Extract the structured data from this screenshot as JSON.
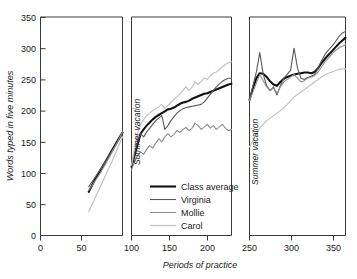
{
  "chart_data": {
    "type": "line",
    "title": "",
    "xlabel": "Periods of practice",
    "ylabel": "Words typed in five minutes",
    "ylim": [
      0,
      350
    ],
    "yticks": [
      0,
      50,
      100,
      150,
      200,
      250,
      300,
      350
    ],
    "xticks": [
      0,
      50,
      100,
      150,
      200,
      250,
      300,
      350
    ],
    "grid": false,
    "legend_position": "inner-lower-left-of-middle-panel",
    "panels": [
      {
        "name": "panel-1",
        "xlim": [
          0,
          85
        ]
      },
      {
        "name": "panel-2",
        "xlim": [
          100,
          232
        ]
      },
      {
        "name": "panel-3",
        "xlim": [
          250,
          362
        ]
      }
    ],
    "annotations": [
      {
        "text": "Summer vacation",
        "panel": "panel-2",
        "orientation": "vertical"
      },
      {
        "text": "Summer vacation",
        "panel": "panel-3",
        "orientation": "vertical"
      }
    ],
    "series": [
      {
        "name": "Class average",
        "color": "#111111",
        "width": 2.1,
        "segments": [
          {
            "x": [
              50,
              56,
              62,
              68,
              74,
              80,
              85
            ],
            "y": [
              70,
              88,
              104,
              120,
              136,
              152,
              165
            ]
          },
          {
            "x": [
              100,
              104,
              108,
              112,
              116,
              120,
              124,
              128,
              132,
              136,
              140,
              144,
              148,
              152,
              156,
              160,
              164,
              168,
              172,
              176,
              180,
              184,
              188,
              192,
              196,
              200,
              204,
              208,
              212,
              216,
              220,
              224,
              228,
              232
            ],
            "y": [
              110,
              128,
              146,
              163,
              170,
              176,
              181,
              186,
              190,
              193,
              196,
              199,
              202,
              203,
              205,
              208,
              211,
              213,
              214,
              216,
              219,
              221,
              223,
              225,
              227,
              228,
              230,
              232,
              234,
              236,
              238,
              240,
              242,
              243
            ]
          },
          {
            "x": [
              250,
              254,
              258,
              262,
              266,
              270,
              274,
              278,
              282,
              286,
              290,
              294,
              298,
              302,
              306,
              310,
              314,
              318,
              322,
              326,
              330,
              334,
              338,
              342,
              346,
              350,
              354,
              358,
              362
            ],
            "y": [
              217,
              236,
              252,
              260,
              259,
              254,
              247,
              242,
              240,
              246,
              251,
              254,
              256,
              258,
              259,
              260,
              261,
              261,
              260,
              262,
              268,
              276,
              283,
              289,
              295,
              301,
              307,
              312,
              317
            ]
          }
        ]
      },
      {
        "name": "Virginia",
        "color": "#5a5a5a",
        "width": 1.1,
        "segments": [
          {
            "x": [
              50,
              56,
              62,
              68,
              74,
              80,
              85
            ],
            "y": [
              78,
              92,
              106,
              120,
              135,
              150,
              163
            ]
          },
          {
            "x": [
              100,
              104,
              108,
              112,
              116,
              120,
              124,
              128,
              132,
              136,
              140,
              144,
              148,
              152,
              156,
              160,
              164,
              168,
              172,
              176,
              180,
              184,
              188,
              192,
              196,
              200,
              204,
              208,
              212,
              216,
              220,
              224,
              228,
              232
            ],
            "y": [
              112,
              130,
              150,
              163,
              158,
              166,
              172,
              178,
              184,
              188,
              192,
              170,
              176,
              184,
              190,
              196,
              200,
              203,
              205,
              206,
              207,
              208,
              209,
              210,
              214,
              220,
              226,
              232,
              238,
              243,
              247,
              250,
              252,
              252
            ]
          },
          {
            "x": [
              250,
              254,
              258,
              262,
              266,
              270,
              274,
              278,
              282,
              286,
              290,
              294,
              298,
              302,
              306,
              310,
              314,
              318,
              322,
              326,
              330,
              334,
              338,
              342,
              346,
              350,
              354,
              358,
              362
            ],
            "y": [
              218,
              240,
              262,
              293,
              258,
              240,
              232,
              238,
              225,
              240,
              252,
              258,
              265,
              300,
              268,
              252,
              250,
              253,
              255,
              258,
              268,
              280,
              290,
              297,
              303,
              310,
              318,
              324,
              327
            ]
          }
        ]
      },
      {
        "name": "Mollie",
        "color": "#8e8e8e",
        "width": 1.1,
        "segments": [
          {
            "x": [
              50,
              56,
              62,
              68,
              74,
              80,
              85
            ],
            "y": [
              72,
              86,
              100,
              116,
              133,
              150,
              166
            ]
          },
          {
            "x": [
              100,
              104,
              108,
              112,
              116,
              120,
              124,
              128,
              132,
              136,
              140,
              144,
              148,
              152,
              156,
              160,
              164,
              168,
              172,
              176,
              180,
              184,
              188,
              192,
              196,
              200,
              204,
              208,
              212,
              216,
              220,
              224,
              228,
              232
            ],
            "y": [
              105,
              118,
              128,
              134,
              130,
              138,
              144,
              140,
              148,
              155,
              150,
              158,
              163,
              158,
              162,
              168,
              165,
              170,
              173,
              168,
              172,
              180,
              176,
              170,
              174,
              178,
              172,
              176,
              170,
              174,
              178,
              172,
              168,
              170
            ]
          },
          {
            "x": [
              250,
              254,
              258,
              262,
              266,
              270,
              274,
              278,
              282,
              286,
              290,
              294,
              298,
              302,
              306,
              310,
              314,
              318,
              322,
              326,
              330,
              334,
              338,
              342,
              346,
              350,
              354,
              358,
              362
            ],
            "y": [
              216,
              230,
              244,
              258,
              248,
              238,
              232,
              236,
              228,
              238,
              246,
              250,
              254,
              258,
              252,
              246,
              248,
              252,
              254,
              256,
              262,
              270,
              278,
              284,
              290,
              296,
              300,
              303,
              305
            ]
          }
        ]
      },
      {
        "name": "Carol",
        "color": "#c2c2c2",
        "width": 1.2,
        "segments": [
          {
            "x": [
              50,
              56,
              62,
              68,
              74,
              80,
              85
            ],
            "y": [
              38,
              58,
              78,
              98,
              118,
              140,
              158
            ]
          },
          {
            "x": [
              100,
              104,
              108,
              112,
              116,
              120,
              124,
              128,
              132,
              136,
              140,
              144,
              148,
              152,
              156,
              160,
              164,
              168,
              172,
              176,
              180,
              184,
              188,
              192,
              196,
              200,
              204,
              208,
              212,
              216,
              220,
              224,
              228,
              232
            ],
            "y": [
              113,
              140,
              164,
              178,
              186,
              192,
              196,
              200,
              203,
              206,
              210,
              204,
              208,
              213,
              218,
              222,
              227,
              233,
              238,
              232,
              238,
              246,
              242,
              247,
              252,
              250,
              256,
              260,
              262,
              266,
              270,
              274,
              277,
              278
            ]
          },
          {
            "x": [
              250,
              254,
              258,
              262,
              266,
              270,
              274,
              278,
              282,
              286,
              290,
              294,
              298,
              302,
              306,
              310,
              314,
              318,
              322,
              326,
              330,
              334,
              338,
              342,
              346,
              350,
              354,
              358,
              362
            ],
            "y": [
              142,
              152,
              162,
              172,
              178,
              184,
              188,
              192,
              196,
              200,
              205,
              210,
              216,
              222,
              226,
              230,
              234,
              238,
              242,
              246,
              250,
              254,
              257,
              260,
              262,
              264,
              266,
              267,
              267
            ]
          }
        ]
      }
    ]
  },
  "legend": {
    "items": [
      {
        "label": "Class average"
      },
      {
        "label": "Virginia"
      },
      {
        "label": "Mollie"
      },
      {
        "label": "Carol"
      }
    ]
  },
  "axes": {
    "y_title": "Words typed in five minutes",
    "x_title": "Periods of practice",
    "y_tick_labels": [
      "0",
      "50",
      "100",
      "150",
      "200",
      "250",
      "300",
      "350"
    ],
    "x_tick_labels_panel1": [
      "0",
      "50"
    ],
    "x_tick_labels_panel2": [
      "100",
      "150",
      "200"
    ],
    "x_tick_labels_panel3": [
      "250",
      "300",
      "350"
    ]
  },
  "annotations": {
    "vacation_1": "Summer vacation",
    "vacation_2": "Summer vacation"
  }
}
